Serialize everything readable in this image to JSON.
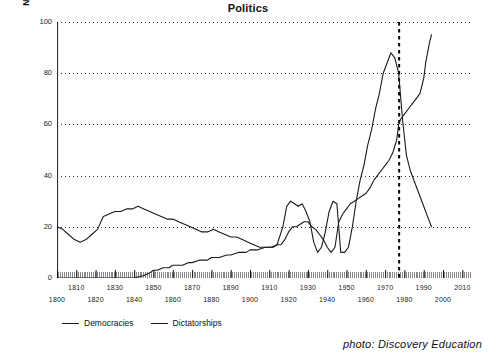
{
  "chart_data": {
    "type": "line",
    "title": "Politics",
    "xlabel": "",
    "ylabel": "Number of Countries (Population > 500, 000)",
    "xlim": [
      1800,
      2015
    ],
    "ylim": [
      0,
      100
    ],
    "grid": true,
    "legend_position": "bottom-left",
    "x_ticks_upper": [
      "1810",
      "1830",
      "1850",
      "1870",
      "1890",
      "1910",
      "1930",
      "1950",
      "1970",
      "1990",
      "2010"
    ],
    "x_ticks_lower": [
      "1800",
      "1820",
      "1840",
      "1860",
      "1880",
      "1900",
      "1920",
      "1940",
      "1960",
      "1980",
      "2000"
    ],
    "y_ticks": [
      "0",
      "20",
      "40",
      "60",
      "80",
      "100"
    ],
    "annotations": [
      {
        "name": "crossover-marker",
        "type": "vertical-dashed-line",
        "x": 1977,
        "label": ""
      }
    ],
    "series": [
      {
        "name": "Democracies",
        "color": "#1a1a1a",
        "x": [
          1800,
          1805,
          1810,
          1815,
          1820,
          1825,
          1830,
          1835,
          1840,
          1845,
          1848,
          1850,
          1852,
          1855,
          1858,
          1860,
          1862,
          1865,
          1868,
          1870,
          1874,
          1878,
          1880,
          1884,
          1888,
          1890,
          1894,
          1898,
          1900,
          1904,
          1908,
          1910,
          1912,
          1914,
          1916,
          1918,
          1920,
          1922,
          1924,
          1926,
          1928,
          1930,
          1932,
          1934,
          1936,
          1938,
          1940,
          1942,
          1944,
          1946,
          1948,
          1950,
          1952,
          1954,
          1956,
          1958,
          1960,
          1962,
          1964,
          1966,
          1968,
          1970,
          1972,
          1974,
          1976,
          1977,
          1978,
          1980,
          1982,
          1984,
          1986,
          1988,
          1990,
          1991,
          1992,
          1993,
          1994
        ],
        "values": [
          0,
          0,
          0,
          0,
          0,
          0,
          0,
          0,
          0,
          1,
          2,
          3,
          3,
          4,
          4,
          5,
          5,
          5,
          6,
          6,
          7,
          7,
          8,
          8,
          9,
          9,
          10,
          10,
          11,
          11,
          12,
          12,
          12,
          13,
          13,
          15,
          18,
          20,
          20,
          21,
          22,
          22,
          20,
          19,
          17,
          15,
          12,
          10,
          12,
          22,
          25,
          27,
          29,
          30,
          31,
          32,
          33,
          35,
          38,
          40,
          42,
          44,
          46,
          49,
          54,
          60,
          62,
          64,
          66,
          68,
          70,
          72,
          78,
          84,
          88,
          92,
          95
        ]
      },
      {
        "name": "Dictatorships",
        "color": "#1a1a1a",
        "x": [
          1800,
          1803,
          1806,
          1809,
          1812,
          1815,
          1818,
          1821,
          1824,
          1827,
          1830,
          1833,
          1836,
          1839,
          1842,
          1845,
          1848,
          1851,
          1854,
          1857,
          1860,
          1863,
          1866,
          1869,
          1872,
          1875,
          1878,
          1881,
          1884,
          1887,
          1890,
          1893,
          1896,
          1899,
          1902,
          1905,
          1908,
          1911,
          1914,
          1917,
          1919,
          1921,
          1923,
          1925,
          1927,
          1929,
          1931,
          1933,
          1935,
          1937,
          1939,
          1941,
          1943,
          1945,
          1947,
          1949,
          1951,
          1953,
          1955,
          1957,
          1959,
          1961,
          1963,
          1965,
          1967,
          1969,
          1971,
          1973,
          1975,
          1977,
          1979,
          1981,
          1983,
          1985,
          1987,
          1989,
          1991,
          1993,
          1994
        ],
        "values": [
          20,
          19,
          17,
          15,
          14,
          15,
          17,
          19,
          24,
          25,
          26,
          26,
          27,
          27,
          28,
          27,
          26,
          25,
          24,
          23,
          23,
          22,
          21,
          20,
          19,
          18,
          18,
          19,
          18,
          17,
          16,
          16,
          15,
          14,
          13,
          12,
          12,
          12,
          13,
          20,
          28,
          30,
          29,
          28,
          29,
          26,
          22,
          14,
          10,
          12,
          18,
          26,
          30,
          29,
          10,
          10,
          12,
          20,
          30,
          38,
          44,
          52,
          58,
          66,
          72,
          80,
          84,
          88,
          86,
          80,
          62,
          48,
          42,
          38,
          34,
          30,
          26,
          22,
          20
        ]
      }
    ]
  },
  "legend": {
    "items": [
      {
        "label": "Democracies"
      },
      {
        "label": "Dictatorships"
      }
    ]
  },
  "credit": {
    "text": "photo: Discovery Education"
  }
}
